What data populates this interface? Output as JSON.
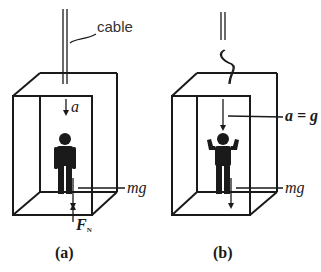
{
  "panels": [
    {
      "id": "a",
      "caption": "(a)",
      "cable_label": "cable",
      "acceleration_label": "a",
      "weight_label": "mg",
      "normal_force_label": "F",
      "normal_force_subscript": "N",
      "cable_state": "intact",
      "person_pose": "standing, arms down"
    },
    {
      "id": "b",
      "caption": "(b)",
      "acceleration_label": "a = g",
      "weight_label": "mg",
      "cable_state": "broken",
      "person_pose": "standing, arms raised"
    }
  ],
  "colors": {
    "line": "#1a1a1a",
    "text": "#1a1a1a",
    "background": "#ffffff"
  }
}
